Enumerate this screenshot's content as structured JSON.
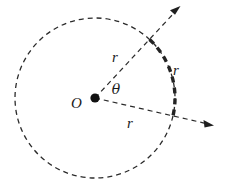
{
  "figure": {
    "background_color": "#ffffff",
    "stroke_color": "#2b2b2b",
    "width": 227,
    "height": 190
  },
  "labels": {
    "center_point": "O",
    "angle": "θ",
    "radius_upper": "r",
    "radius_lower": "r",
    "arc_length": "r"
  },
  "geometry": {
    "center": {
      "x": 95,
      "y": 98
    },
    "circle_radius": 80,
    "center_dot_radius": 4.5,
    "upper_ray_angle_deg": 47,
    "lower_ray_angle_deg": -13,
    "upper_ray_tip": {
      "x": 180,
      "y": 6
    },
    "lower_ray_tip": {
      "x": 214,
      "y": 125
    },
    "arc_start_angle_deg": 47,
    "arc_end_angle_deg": -13
  },
  "styles": {
    "circle_dash": "5 4",
    "circle_stroke_width": 1.3,
    "ray_dash": "5 4",
    "ray_stroke_width": 1.2,
    "arc_dash": "6 5",
    "arc_stroke_width": 3.4
  },
  "label_positions": {
    "center_point": {
      "x": 78,
      "y": 107
    },
    "angle": {
      "x": 115,
      "y": 94
    },
    "radius_upper": {
      "x": 113,
      "y": 61
    },
    "radius_lower": {
      "x": 128,
      "y": 128
    },
    "arc_length": {
      "x": 174,
      "y": 75
    }
  }
}
